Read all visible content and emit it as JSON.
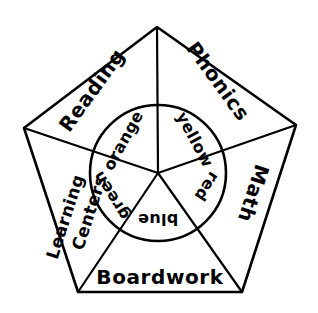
{
  "figure": {
    "background_color": "#ffffff",
    "stroke_color": "#000000",
    "style": "hand-drawn pentagon divided into five sectors with an inner circle of five color wedges"
  },
  "outer_sectors": [
    {
      "id": "phonics",
      "label": "Phonics",
      "position": "top-right",
      "rotation_deg": 54
    },
    {
      "id": "math",
      "label": "Math",
      "position": "right",
      "rotation_deg": 108
    },
    {
      "id": "boardwork",
      "label": "Boardwork",
      "position": "bottom",
      "rotation_deg": 0
    },
    {
      "id": "learning-centers",
      "label_line1": "Learning",
      "label_line2": "Centers",
      "position": "left",
      "rotation_deg": -72
    },
    {
      "id": "reading",
      "label": "Reading",
      "position": "top-left",
      "rotation_deg": -54
    }
  ],
  "inner_wedges": [
    {
      "id": "yellow",
      "label": "yellow",
      "position": "top-right",
      "rotation_deg": 62
    },
    {
      "id": "red",
      "label": "red",
      "position": "right",
      "rotation_deg": 123
    },
    {
      "id": "blue",
      "label": "blue",
      "position": "bottom",
      "rotation_deg": 180
    },
    {
      "id": "green",
      "label": "green",
      "position": "left",
      "rotation_deg": -122
    },
    {
      "id": "orange",
      "label": "orange",
      "position": "top-left",
      "rotation_deg": -61
    }
  ],
  "geometry": {
    "center_x": 158,
    "center_y": 173,
    "inner_radius": 68,
    "vertices": [
      {
        "name": "top",
        "x": 157,
        "y": 27
      },
      {
        "name": "right",
        "x": 296,
        "y": 125
      },
      {
        "name": "bottom-right",
        "x": 242,
        "y": 292
      },
      {
        "name": "bottom-left",
        "x": 78,
        "y": 292
      },
      {
        "name": "left",
        "x": 24,
        "y": 128
      }
    ]
  }
}
